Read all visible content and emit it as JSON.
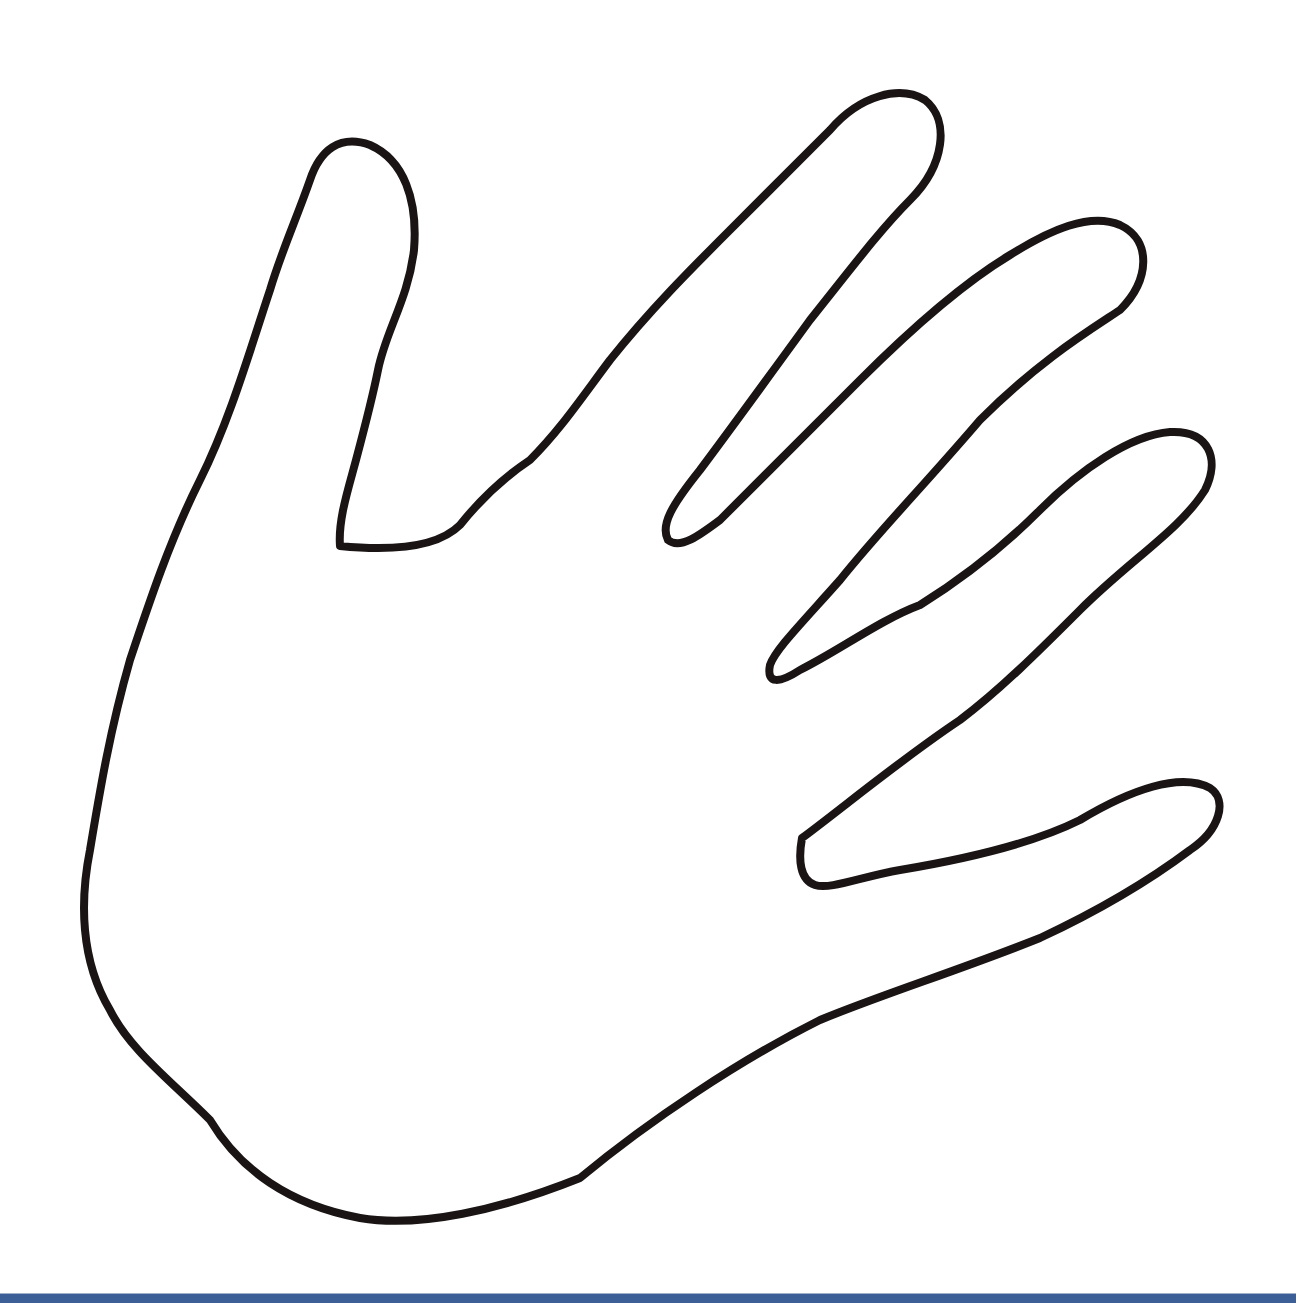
{
  "image": {
    "subject": "hand outline",
    "description": "Black outline drawing of an open left hand with five fingers spread, on white background"
  },
  "colors": {
    "background": "#ffffff",
    "stroke": "#1a1414",
    "bottom_bar": "#3b5f96"
  },
  "stroke_width": 8
}
